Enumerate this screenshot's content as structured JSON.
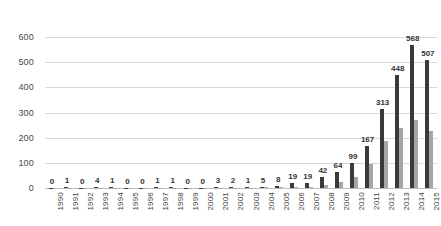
{
  "chart_data": {
    "type": "bar",
    "title": "",
    "subtitle": "",
    "xlabel": "",
    "ylabel": "",
    "ylim": [
      0,
      600
    ],
    "ytick_step": 100,
    "yticks": [
      "0",
      "100",
      "200",
      "300",
      "400",
      "500",
      "600"
    ],
    "grid": true,
    "legend": "none",
    "orientation": "vertical",
    "grouping": "clustered",
    "categories": [
      "1990",
      "1991",
      "1992",
      "1993",
      "1994",
      "1995",
      "1996",
      "1997",
      "1998",
      "1999",
      "2000",
      "2001",
      "2002",
      "2003",
      "2004",
      "2005",
      "2006",
      "2007",
      "2008",
      "2009",
      "2010",
      "2011",
      "2012",
      "2013",
      "2014",
      "2015"
    ],
    "series": [
      {
        "name": "series-1-dark",
        "color": "#3a3a3a",
        "labels_shown": true,
        "values": [
          0,
          1,
          0,
          4,
          1,
          0,
          0,
          1,
          1,
          0,
          0,
          3,
          2,
          1,
          5,
          8,
          19,
          19,
          42,
          64,
          99,
          167,
          313,
          448,
          568,
          507
        ],
        "data_labels": [
          "0",
          "1",
          "0",
          "4",
          "1",
          "0",
          "0",
          "1",
          "1",
          "0",
          "0",
          "3",
          "2",
          "1",
          "5",
          "8",
          "19",
          "19",
          "42",
          "64",
          "99",
          "167",
          "313",
          "448",
          "568",
          "507"
        ]
      },
      {
        "name": "series-2-light",
        "color": "#a6a6a6",
        "labels_shown": false,
        "values": [
          0,
          0,
          0,
          0,
          0,
          0,
          0,
          0,
          0,
          0,
          0,
          0,
          0,
          0,
          1,
          2,
          4,
          5,
          12,
          25,
          45,
          95,
          185,
          240,
          270,
          225
        ],
        "data_labels": []
      }
    ]
  },
  "colors": {
    "series_dark": "#3a3a3a",
    "series_light": "#a6a6a6",
    "gridline": "#d9d9d9",
    "axis": "#bfbfbf",
    "text": "#3f3f3f",
    "background": "#ffffff"
  }
}
